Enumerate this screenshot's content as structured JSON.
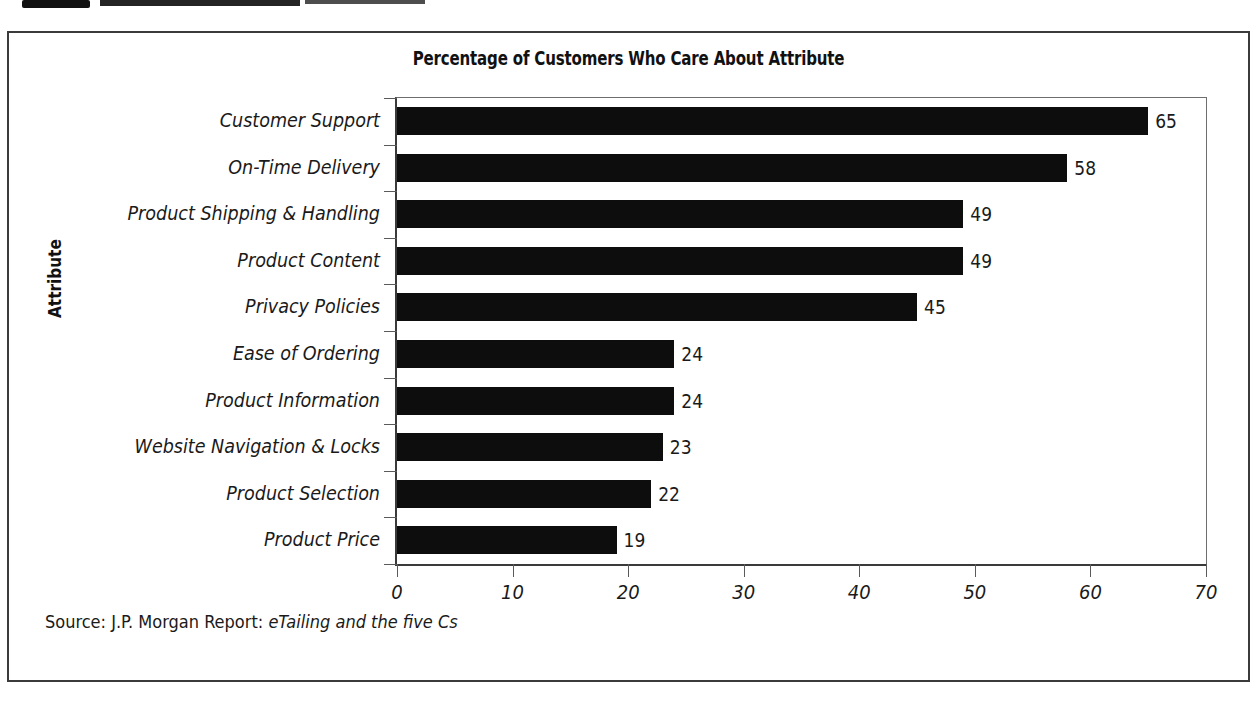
{
  "figure": {
    "title": "Percentage of Customers Who Care About Attribute",
    "source_prefix": "Source: J.P. Morgan Report:",
    "source_title": "eTailing and the five Cs"
  },
  "chart_data": {
    "type": "bar",
    "orientation": "horizontal",
    "title": "Percentage of Customers Who Care About Attribute",
    "xlabel": "",
    "ylabel": "Attribute",
    "xlim": [
      0,
      70
    ],
    "xticks": [
      "0",
      "10",
      "20",
      "30",
      "40",
      "50",
      "60",
      "70"
    ],
    "xtick_values": [
      0,
      10,
      20,
      30,
      40,
      50,
      60,
      70
    ],
    "grid": false,
    "legend": "none",
    "bar_color": "#0d0d0d",
    "categories": [
      "Customer Support",
      "On-Time Delivery",
      "Product Shipping & Handling",
      "Product Content",
      "Privacy Policies",
      "Ease of Ordering",
      "Product Information",
      "Website Navigation & Locks",
      "Product Selection",
      "Product Price"
    ],
    "values": [
      65,
      58,
      49,
      49,
      45,
      24,
      24,
      23,
      22,
      19
    ],
    "value_labels": [
      "65",
      "58",
      "49",
      "49",
      "45",
      "24",
      "24",
      "23",
      "22",
      "19"
    ]
  }
}
